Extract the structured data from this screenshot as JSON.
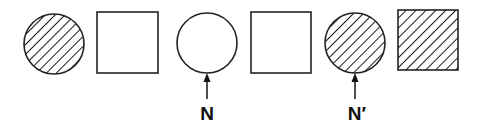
{
  "diagram": {
    "stroke_color": "#222222",
    "hatch_color": "#1a1a1a",
    "shapes": [
      {
        "type": "circle",
        "fill": "hatched",
        "cx": 54,
        "cy": 44,
        "r": 30
      },
      {
        "type": "square",
        "fill": "empty",
        "x": 97,
        "y": 12,
        "w": 61,
        "h": 61
      },
      {
        "type": "circle",
        "fill": "empty",
        "cx": 207,
        "cy": 43,
        "r": 30
      },
      {
        "type": "square",
        "fill": "empty",
        "x": 251,
        "y": 12,
        "w": 60,
        "h": 61
      },
      {
        "type": "circle",
        "fill": "hatched",
        "cx": 355,
        "cy": 43,
        "r": 30
      },
      {
        "type": "square",
        "fill": "hatched",
        "x": 398,
        "y": 10,
        "w": 60,
        "h": 60
      }
    ],
    "pointers": [
      {
        "target_index": 2,
        "label": "N",
        "x": 207,
        "y_top": 73,
        "y_bottom": 99
      },
      {
        "target_index": 4,
        "label": "N′",
        "x": 355,
        "y_top": 73,
        "y_bottom": 99
      }
    ]
  }
}
